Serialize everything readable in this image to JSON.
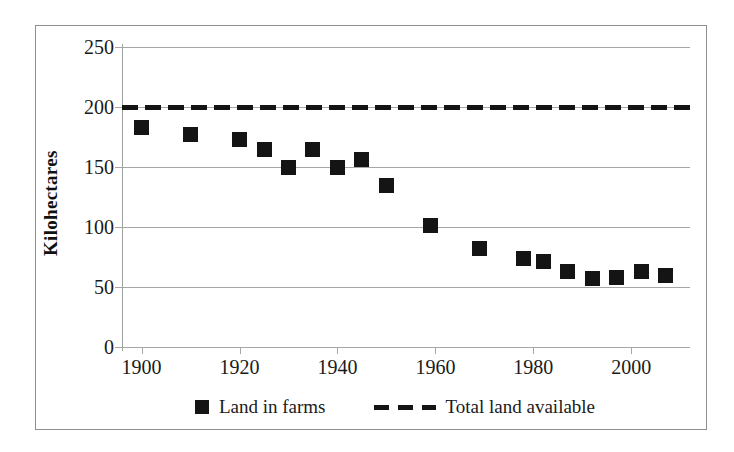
{
  "chart_data": {
    "type": "scatter",
    "title": "",
    "subtitle": "",
    "xlabel": "",
    "ylabel": "Kilohectares",
    "xlim": [
      1896,
      2012
    ],
    "ylim": [
      0,
      250
    ],
    "grid": true,
    "x_ticks": [
      "1900",
      "1920",
      "1940",
      "1960",
      "1980",
      "2000"
    ],
    "x_tick_values": [
      1900,
      1920,
      1940,
      1960,
      1980,
      2000
    ],
    "y_ticks": [
      "0",
      "50",
      "100",
      "150",
      "200",
      "250"
    ],
    "y_tick_values": [
      0,
      50,
      100,
      150,
      200,
      250
    ],
    "legend_position": "bottom",
    "series": [
      {
        "name": "Land in farms",
        "marker": "square",
        "color": "#141414",
        "style": "points",
        "x": [
          1900,
          1910,
          1920,
          1925,
          1930,
          1935,
          1940,
          1945,
          1950,
          1959,
          1969,
          1978,
          1982,
          1987,
          1992,
          1997,
          2002,
          2007
        ],
        "values": [
          183,
          177,
          173,
          165,
          150,
          165,
          150,
          156,
          135,
          101,
          82,
          74,
          71,
          63,
          57,
          58,
          63,
          60
        ]
      },
      {
        "name": "Total land available",
        "marker": "none",
        "color": "#141414",
        "style": "dashed-line",
        "constant_value": 200,
        "x": [
          1896,
          2012
        ],
        "values": [
          200,
          200
        ]
      }
    ]
  },
  "axes": {
    "y_title": "Kilohectares",
    "y_tick_labels": [
      "250",
      "200",
      "150",
      "100",
      "50",
      "0"
    ],
    "x_tick_labels": [
      "1900",
      "1920",
      "1940",
      "1960",
      "1980",
      "2000"
    ]
  },
  "legend": {
    "entries": [
      {
        "label": "Land in farms",
        "swatch": "square-marker-icon"
      },
      {
        "label": "Total land available",
        "swatch": "dashed-line-icon"
      }
    ]
  },
  "colors": {
    "data": "#141414",
    "grid": "#a6a6a6",
    "frame": "#8f8f8f",
    "text": "#1a1a1a",
    "background": "#ffffff"
  }
}
